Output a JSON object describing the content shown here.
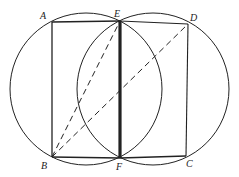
{
  "diagram": {
    "type": "geometry-figure",
    "points": {
      "A": {
        "label": "A",
        "x": 52,
        "y": 22
      },
      "E": {
        "label": "E",
        "x": 120,
        "y": 21
      },
      "D": {
        "label": "D",
        "x": 188,
        "y": 24
      },
      "B": {
        "label": "B",
        "x": 52,
        "y": 157
      },
      "F": {
        "label": "F",
        "x": 120,
        "y": 158
      },
      "C": {
        "label": "C",
        "x": 186,
        "y": 156
      }
    },
    "circles": [
      {
        "name": "left-circle",
        "cx": 86,
        "cy": 89,
        "r": 76
      },
      {
        "name": "right-circle",
        "cx": 153,
        "cy": 89,
        "r": 76
      }
    ],
    "segments": [
      {
        "from": "A",
        "to": "E",
        "style": "solid"
      },
      {
        "from": "E",
        "to": "D",
        "style": "solid"
      },
      {
        "from": "A",
        "to": "B",
        "style": "solid"
      },
      {
        "from": "B",
        "to": "F",
        "style": "solid"
      },
      {
        "from": "F",
        "to": "C",
        "style": "solid"
      },
      {
        "from": "D",
        "to": "C",
        "style": "solid"
      },
      {
        "from": "E",
        "to": "F",
        "style": "bold"
      },
      {
        "from": "B",
        "to": "E",
        "style": "dashed"
      },
      {
        "from": "B",
        "to": "D",
        "style": "dashed"
      }
    ],
    "colors": {
      "stroke": "#222222",
      "background": "#ffffff"
    }
  }
}
